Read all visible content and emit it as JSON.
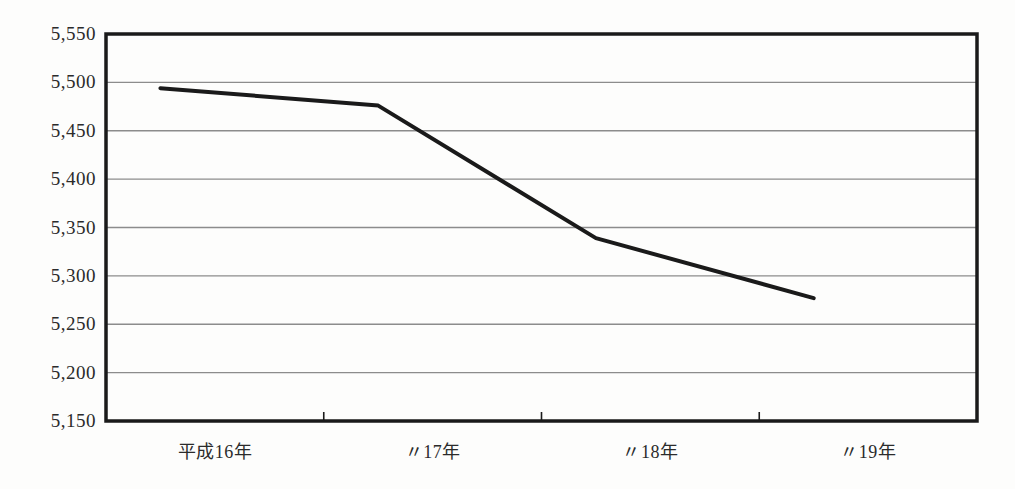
{
  "chart_data": {
    "type": "line",
    "title": "",
    "xlabel": "",
    "ylabel": "",
    "categories": [
      "平成16年",
      "〃17年",
      "〃18年",
      "〃19年"
    ],
    "values": [
      5494,
      5476,
      5339,
      5277
    ],
    "series": [
      {
        "name": "",
        "values": [
          5494,
          5476,
          5339,
          5277
        ]
      }
    ],
    "ylim": [
      5150,
      5550
    ],
    "ytick_step": 50,
    "ytick_labels": [
      "5,550",
      "5,500",
      "5,450",
      "5,400",
      "5,350",
      "5,300",
      "5,250",
      "5,200",
      "5,150"
    ],
    "ytick_values": [
      5550,
      5500,
      5450,
      5400,
      5350,
      5300,
      5250,
      5200,
      5150
    ],
    "grid": true,
    "grid_axis": "y",
    "legend": false,
    "legend_position": "none",
    "line_color": "#1a1a1a",
    "line_width": 4,
    "grid_color": "#8c8c8c",
    "border_color": "#1a1a1a",
    "background_color": "#fdfdfc",
    "markers": false,
    "annotations": []
  },
  "figure": {
    "title_text": ""
  }
}
